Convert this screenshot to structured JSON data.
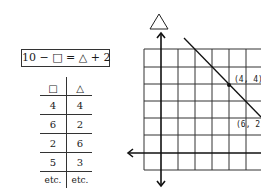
{
  "equation": {
    "text": "10 − □ = △ + 2"
  },
  "table": {
    "headers": [
      "□",
      "△"
    ],
    "rows": [
      [
        "4",
        "4"
      ],
      [
        "6",
        "2"
      ],
      [
        "2",
        "6"
      ],
      [
        "5",
        "3"
      ],
      [
        "etc.",
        "etc."
      ]
    ]
  },
  "graph": {
    "y_axis_label": "△",
    "points": [
      {
        "label": "(4, 4)",
        "x": 4,
        "y": 4,
        "marked": true
      },
      {
        "label": "(6, 2)",
        "x": 6,
        "y": 2,
        "marked": false
      }
    ],
    "line": {
      "equation": "△ = 8 − □"
    },
    "grid": {
      "x_min": -1,
      "x_max": 6,
      "y_min": -1,
      "y_max": 6
    }
  },
  "colors": {
    "ink": "#1a1a1a",
    "background": "#ffffff"
  }
}
